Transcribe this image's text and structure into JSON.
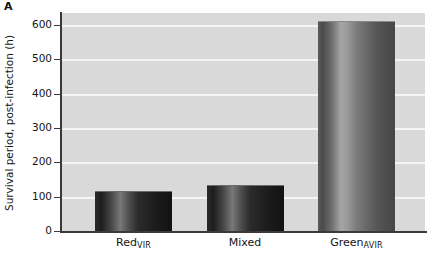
{
  "panel": {
    "label": "A"
  },
  "chart_data": {
    "type": "bar",
    "title": "",
    "subtitle": "",
    "xlabel": "",
    "ylabel": "Survival period, post-infection (h)",
    "categories": [
      "Red",
      "Mixed",
      "Green"
    ],
    "category_labels": [
      "RedVIR",
      "Mixed",
      "GreenAVIR"
    ],
    "category_base": [
      "Red",
      "Mixed",
      "Green"
    ],
    "category_subscript": [
      "VIR",
      "",
      "AVIR"
    ],
    "values": [
      117,
      135,
      612
    ],
    "ylim": [
      0,
      635
    ],
    "yticks": [
      0,
      100,
      200,
      300,
      400,
      500,
      600
    ],
    "ytick_labels": [
      "0",
      "100",
      "200",
      "300",
      "400",
      "500",
      "600"
    ],
    "grid": true,
    "grid_axis": "y",
    "grid_color": "#f4f4f4",
    "plot_background": "#d9d9d9",
    "legend": false,
    "legend_position": "none",
    "bar_styles": [
      "dark",
      "dark",
      "light"
    ],
    "axis_color": "#3a3a3a"
  }
}
